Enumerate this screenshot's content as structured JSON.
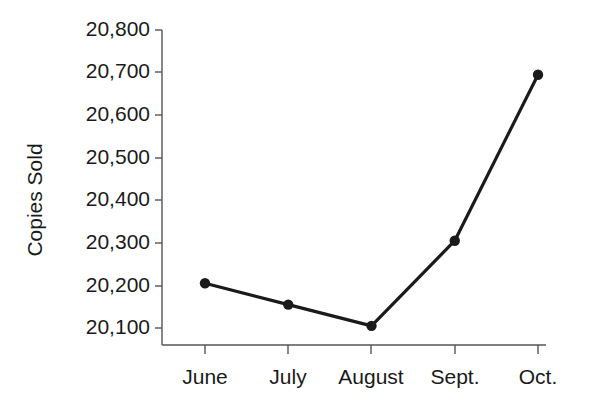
{
  "chart_data": {
    "type": "line",
    "title": "",
    "subtitle": "",
    "xlabel": "",
    "ylabel": "Copies Sold",
    "categories": [
      "June",
      "July",
      "August",
      "Sept.",
      "Oct."
    ],
    "values": [
      20205,
      20155,
      20105,
      20305,
      20695
    ],
    "series": [
      {
        "name": "Copies Sold",
        "values": [
          20205,
          20155,
          20105,
          20305,
          20695
        ]
      }
    ],
    "ylim": [
      20100,
      20800
    ],
    "ytick_values": [
      20100,
      20200,
      20300,
      20400,
      20500,
      20600,
      20700,
      20800
    ],
    "ytick_labels": [
      "20,100",
      "20,200",
      "20,300",
      "20,400",
      "20,500",
      "20,600",
      "20,700",
      "20,800"
    ],
    "grid": false,
    "legend": false,
    "legend_position": "none",
    "marker": "circle",
    "line_color": "#1a1a1a",
    "marker_color": "#1a1a1a",
    "axis_color": "#555555",
    "background_color": "#ffffff"
  },
  "axes": {
    "y_title": "Copies Sold",
    "y_ticks": [
      {
        "label": "20,800",
        "value": 20800
      },
      {
        "label": "20,700",
        "value": 20700
      },
      {
        "label": "20,600",
        "value": 20600
      },
      {
        "label": "20,500",
        "value": 20500
      },
      {
        "label": "20,400",
        "value": 20400
      },
      {
        "label": "20,300",
        "value": 20300
      },
      {
        "label": "20,200",
        "value": 20200
      },
      {
        "label": "20,100",
        "value": 20100
      }
    ],
    "x_ticks": [
      {
        "label": "June"
      },
      {
        "label": "July"
      },
      {
        "label": "August"
      },
      {
        "label": "Sept."
      },
      {
        "label": "Oct."
      }
    ]
  }
}
